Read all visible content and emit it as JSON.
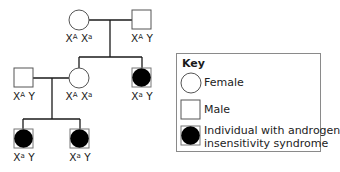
{
  "diagram": {
    "type": "pedigree",
    "trait": "androgen insensitivity syndrome",
    "generations": [
      {
        "id": "I",
        "individuals": [
          {
            "sex": "female",
            "affected": false,
            "genotype": {
              "allele1": "A",
              "allele2": "a"
            },
            "label_parts": [
              "X",
              "A",
              " X",
              "a"
            ]
          },
          {
            "sex": "male",
            "affected": false,
            "genotype": {
              "allele1": "A",
              "allele2": "Y"
            },
            "label_parts": [
              "X",
              "A",
              " Y",
              ""
            ]
          }
        ]
      },
      {
        "id": "II",
        "individuals": [
          {
            "sex": "male",
            "affected": false,
            "label_parts": [
              "X",
              "A",
              " Y",
              ""
            ]
          },
          {
            "sex": "female",
            "affected": false,
            "label_parts": [
              "X",
              "A",
              " X",
              "a"
            ]
          },
          {
            "sex": "male",
            "affected": true,
            "label_parts": [
              "X",
              "a",
              " Y",
              ""
            ]
          }
        ]
      },
      {
        "id": "III",
        "individuals": [
          {
            "sex": "male",
            "affected": true,
            "label_parts": [
              "X",
              "a",
              " Y",
              ""
            ]
          },
          {
            "sex": "male",
            "affected": true,
            "label_parts": [
              "X",
              "a",
              " Y",
              ""
            ]
          }
        ]
      }
    ]
  },
  "key": {
    "title": "Key",
    "items": [
      {
        "symbol": "circle-open",
        "label": "Female"
      },
      {
        "symbol": "square-open",
        "label": "Male"
      },
      {
        "symbol": "circle-filled",
        "label_line1": "Individual with androgen",
        "label_line2": "insensitivity syndrome"
      }
    ]
  },
  "colors": {
    "line": "#1a1a1a",
    "fill_affected": "#000000",
    "symbol_border": "#555555"
  }
}
